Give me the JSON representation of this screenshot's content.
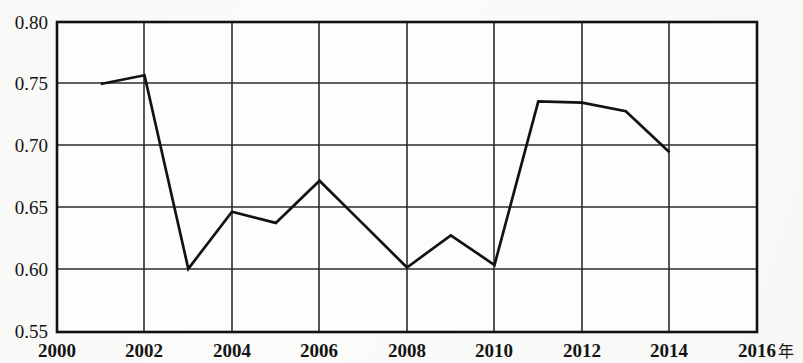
{
  "chart_data": {
    "type": "line",
    "title": "",
    "subtitle": "",
    "xlabel": "年",
    "ylabel": "",
    "xlim": [
      2000,
      2016
    ],
    "ylim": [
      0.55,
      0.8
    ],
    "grid": true,
    "legend_position": "none",
    "x_ticks": [
      "2000",
      "2002",
      "2004",
      "2006",
      "2008",
      "2010",
      "2012",
      "2014",
      "2016"
    ],
    "x_tick_values": [
      2000,
      2002,
      2004,
      2006,
      2008,
      2010,
      2012,
      2014,
      2016
    ],
    "y_ticks": [
      "0.55",
      "0.60",
      "0.65",
      "0.70",
      "0.75",
      "0.80"
    ],
    "y_tick_values": [
      0.55,
      0.6,
      0.65,
      0.7,
      0.75,
      0.8
    ],
    "x": [
      2001,
      2002,
      2003,
      2004,
      2005,
      2006,
      2007,
      2008,
      2009,
      2010,
      2011,
      2012,
      2013,
      2014
    ],
    "values": [
      0.75,
      0.757,
      0.601,
      0.647,
      0.638,
      0.672,
      0.637,
      0.602,
      0.628,
      0.604,
      0.736,
      0.735,
      0.728,
      0.695
    ],
    "series": [
      {
        "name": "",
        "x": [
          2001,
          2002,
          2003,
          2004,
          2005,
          2006,
          2007,
          2008,
          2009,
          2010,
          2011,
          2012,
          2013,
          2014
        ],
        "values": [
          0.75,
          0.757,
          0.601,
          0.647,
          0.638,
          0.672,
          0.637,
          0.602,
          0.628,
          0.604,
          0.736,
          0.735,
          0.728,
          0.695
        ],
        "color": "#121212"
      }
    ],
    "colors": {
      "line": "#121212",
      "grid": "#2b2b2b",
      "axis": "#111111",
      "background": "#fbfbf9",
      "text": "#141414"
    }
  },
  "axis": {
    "x_unit_label": "年"
  }
}
